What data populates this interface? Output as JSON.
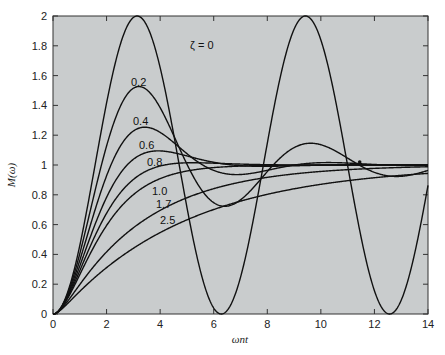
{
  "chart_data": {
    "type": "line",
    "title": "",
    "xlabel": "ωnt",
    "ylabel": "M(ω)",
    "xlim": [
      0,
      14
    ],
    "ylim": [
      0,
      2
    ],
    "xticks": [
      0,
      2,
      4,
      6,
      8,
      10,
      12,
      14
    ],
    "yticks": [
      0,
      0.2,
      0.4,
      0.6,
      0.8,
      1,
      1.2,
      1.4,
      1.6,
      1.8,
      2
    ],
    "ytick_labels": [
      "0",
      "0.2",
      "0.4",
      "0.6",
      "0.8",
      "1",
      "1.2",
      "1.4",
      "1.6",
      "1.8",
      "2"
    ],
    "xtick_labels": [
      "0",
      "2",
      "4",
      "6",
      "8",
      "10",
      "12",
      "14"
    ],
    "grid": false,
    "background": "#c9cccd",
    "line_color": "#111111",
    "series": [
      {
        "name": "ζ = 0",
        "zeta": 0,
        "label_pos": [
          190,
          49
        ]
      },
      {
        "name": "0.2",
        "zeta": 0.2,
        "label_pos": [
          131,
          86
        ]
      },
      {
        "name": "0.4",
        "zeta": 0.4,
        "label_pos": [
          133,
          125
        ]
      },
      {
        "name": "0.6",
        "zeta": 0.6,
        "label_pos": [
          139,
          149
        ]
      },
      {
        "name": "0.8",
        "zeta": 0.8,
        "label_pos": [
          147,
          166
        ]
      },
      {
        "name": "1.0",
        "zeta": 1.0,
        "label_pos": [
          152,
          195
        ]
      },
      {
        "name": "1.7",
        "zeta": 1.7,
        "label_pos": [
          156,
          208
        ]
      },
      {
        "name": "2.5",
        "zeta": 2.5,
        "label_pos": [
          160,
          224
        ]
      }
    ],
    "annotations": [
      {
        "type": "dot",
        "x": 11.45,
        "y": 1.02
      }
    ]
  }
}
